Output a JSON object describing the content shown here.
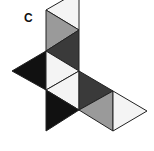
{
  "label": "C",
  "colors": {
    "white": "#f4f4f4",
    "gray": "#9a9a9a",
    "dark": "#3a3a3a",
    "black": "#111111",
    "stroke": "#222222"
  },
  "faces": [
    {
      "id": "t1",
      "fill": "white",
      "points": "46,10 79,-9 79,30"
    },
    {
      "id": "t2",
      "fill": "gray",
      "points": "46,10 79,30 46,51"
    },
    {
      "id": "t3",
      "fill": "dark",
      "points": "46,51 79,30 79,71"
    },
    {
      "id": "t4",
      "fill": "black",
      "points": "12,71 46,51 46,90"
    },
    {
      "id": "t5",
      "fill": "white",
      "points": "46,51 79,71 46,90"
    },
    {
      "id": "t6",
      "fill": "white",
      "points": "46,90 79,71 79,110"
    },
    {
      "id": "t7",
      "fill": "dark",
      "points": "79,71 113,91 79,110"
    },
    {
      "id": "t8",
      "fill": "black",
      "points": "46,90 79,110 46,131"
    },
    {
      "id": "t9",
      "fill": "gray",
      "points": "79,110 113,91 113,131"
    },
    {
      "id": "t10",
      "fill": "white",
      "points": "113,91 147,111 113,131"
    }
  ]
}
